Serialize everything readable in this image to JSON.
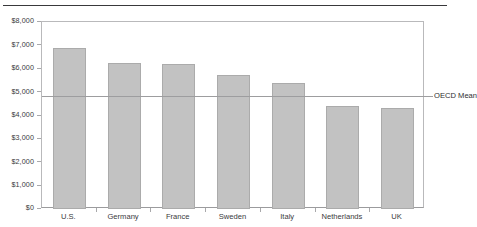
{
  "chart_data": {
    "type": "bar",
    "title": "",
    "subtitle": "",
    "xlabel": "",
    "ylabel": "",
    "categories": [
      "U.S.",
      "Germany",
      "France",
      "Sweden",
      "Italy",
      "Netherlands",
      "UK"
    ],
    "values": [
      6900,
      6250,
      6200,
      5750,
      5400,
      4400,
      4320
    ],
    "series": [
      {
        "name": "Health spending per capita",
        "values": [
          6900,
          6250,
          6200,
          5750,
          5400,
          4400,
          4320
        ]
      }
    ],
    "ylim": [
      0,
      8000
    ],
    "ytick_values": [
      0,
      1000,
      2000,
      3000,
      4000,
      5000,
      6000,
      7000,
      8000
    ],
    "ytick_labels": [
      "$0",
      "$1,000",
      "$2,000",
      "$3,000",
      "$4,000",
      "$5,000",
      "$6,000",
      "$7,000",
      "$8,000"
    ],
    "grid": false,
    "legend": "none",
    "annotations": [
      {
        "name": "oecd-mean",
        "label": "OECD Mean",
        "value": 4800,
        "type": "horizontal-line",
        "label_position": "right"
      }
    ],
    "colors": {
      "bar_fill": "#c2c2c2",
      "bar_stroke": "#ababab",
      "axis": "#b9b9bb",
      "text": "#3a3a3c",
      "mean_line": "#9d9d9f",
      "top_rule": "#39393b"
    }
  }
}
